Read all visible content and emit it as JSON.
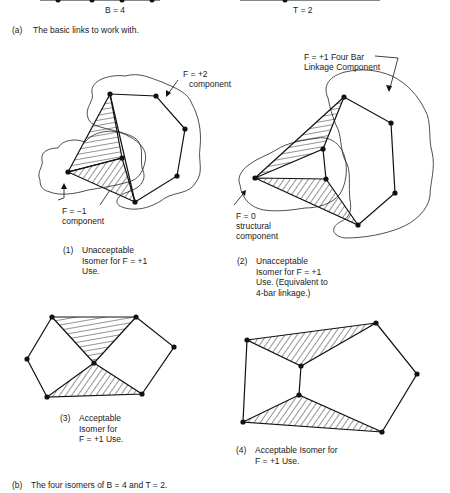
{
  "top_strip": {
    "b_label": "B = 4",
    "t_label": "T = 2"
  },
  "section_a": {
    "label": "(a)",
    "text": "The basic links to work with."
  },
  "isomers": [
    {
      "number": "(1)",
      "caption": "Unacceptable\nIsomer for F = +1\nUse.",
      "annotations": [
        {
          "text_line1": "F = +2",
          "text_line2": "component"
        },
        {
          "text_line1": "F = −1",
          "text_line2": "component"
        }
      ]
    },
    {
      "number": "(2)",
      "caption": "Unacceptable\nIsomer for F = +1\nUse.  (Equivalent to\n4-bar linkage.)",
      "annotations": [
        {
          "text_line1": "F = +1 Four Bar",
          "text_line2": "Linkage Component"
        },
        {
          "text_line1": "F = 0",
          "text_line2": "structural",
          "text_line3": "component"
        }
      ]
    },
    {
      "number": "(3)",
      "caption": "Acceptable\nIsomer for\nF = +1 Use."
    },
    {
      "number": "(4)",
      "caption": "Acceptable Isomer for\nF = +1 Use."
    }
  ],
  "section_b": {
    "label": "(b)",
    "text": "The four isomers of B = 4 and T = 2."
  },
  "colors": {
    "ink": "#111111",
    "background": "#ffffff"
  }
}
